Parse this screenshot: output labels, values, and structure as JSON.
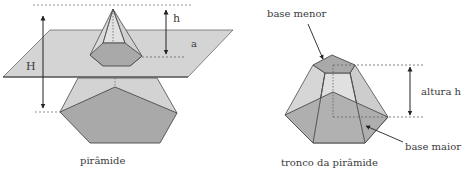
{
  "figures": {
    "pyramid": {
      "caption": "pirâmide",
      "labels": {
        "total_height": "H",
        "cut_height": "h",
        "plane": "a"
      }
    },
    "frustum": {
      "caption": "tronco da pirâmide",
      "labels": {
        "small_base": "base menor",
        "large_base": "base maior",
        "height": "altura h"
      }
    }
  },
  "colors": {
    "plane_fill": "#d4d4d4",
    "light_face": "#d6d6d6",
    "mid_face": "#bdbdbd",
    "dark_base": "#a6a6a6",
    "stroke": "#4a4a4a",
    "dashed": "#6a6a6a"
  }
}
